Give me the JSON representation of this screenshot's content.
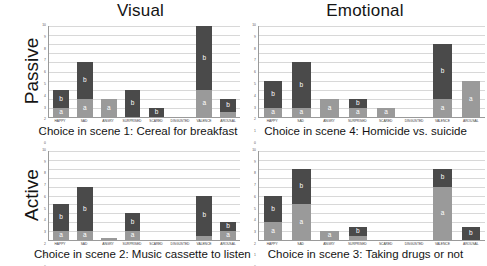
{
  "columns": [
    {
      "title": "Visual"
    },
    {
      "title": "Emotional"
    }
  ],
  "rows": [
    {
      "label": "Passive"
    },
    {
      "label": "Active"
    }
  ],
  "axis": {
    "ticks": [
      "0",
      "1",
      "2",
      "3",
      "4",
      "5",
      "6",
      "7",
      "8",
      "9",
      "10"
    ],
    "ymin": 0,
    "ymax": 10,
    "categories": [
      "HAPPY",
      "SAD",
      "ANGRY",
      "SURPRISED",
      "SCARED",
      "DISGUSTED",
      "VALENCE",
      "AROUSAL"
    ]
  },
  "legend": {
    "segment_a": "a",
    "segment_b": "b"
  },
  "colors": {
    "segment_a": "#9a9a9a",
    "segment_b": "#4a4a4a",
    "grid": "#d8d8d8",
    "axis": "#9a9a9a"
  },
  "chart_data": [
    {
      "type": "bar",
      "id": "panel-top-left",
      "title": "Visual",
      "row": "Passive",
      "caption": "Choice in scene 1: Cereal for breakfast",
      "xlabel": "",
      "ylabel": "",
      "ylim": [
        0,
        10
      ],
      "grid": true,
      "stacked": true,
      "categories": [
        "HAPPY",
        "SAD",
        "ANGRY",
        "SURPRISED",
        "SCARED",
        "DISGUSTED",
        "VALENCE",
        "AROUSAL"
      ],
      "series": [
        {
          "name": "a",
          "values": [
            1,
            2,
            2,
            0,
            0,
            0,
            3,
            0.5
          ]
        },
        {
          "name": "b",
          "values": [
            2,
            4,
            0,
            3,
            1,
            0,
            7,
            1.5
          ]
        }
      ],
      "totals": [
        3,
        6,
        2,
        3,
        1,
        0,
        10,
        2
      ]
    },
    {
      "type": "bar",
      "id": "panel-top-right",
      "title": "Emotional",
      "row": "Passive",
      "caption": "Choice in scene 4: Homicide vs. suicide",
      "xlabel": "",
      "ylabel": "",
      "ylim": [
        0,
        10
      ],
      "grid": true,
      "stacked": true,
      "categories": [
        "HAPPY",
        "SAD",
        "ANGRY",
        "SURPRISED",
        "SCARED",
        "DISGUSTED",
        "VALENCE",
        "AROUSAL"
      ],
      "series": [
        {
          "name": "a",
          "values": [
            1,
            1,
            2,
            1,
            1,
            0,
            2,
            4
          ]
        },
        {
          "name": "b",
          "values": [
            3,
            5,
            0,
            1,
            0,
            0,
            6,
            0
          ]
        }
      ],
      "totals": [
        4,
        6,
        2,
        2,
        1,
        0,
        8,
        4
      ]
    },
    {
      "type": "bar",
      "id": "panel-bottom-left",
      "title": "Visual",
      "row": "Active",
      "caption": "Choice in scene 2: Music cassette to listen",
      "xlabel": "",
      "ylabel": "",
      "ylim": [
        0,
        10
      ],
      "grid": true,
      "stacked": true,
      "categories": [
        "HAPPY",
        "SAD",
        "ANGRY",
        "SURPRISED",
        "SCARED",
        "DISGUSTED",
        "VALENCE",
        "AROUSAL"
      ],
      "series": [
        {
          "name": "a",
          "values": [
            1,
            1,
            0.5,
            1,
            0,
            0,
            0.5,
            1
          ]
        },
        {
          "name": "b",
          "values": [
            3,
            5,
            0,
            2,
            0,
            0,
            4.5,
            1
          ]
        }
      ],
      "totals": [
        4,
        6,
        0.5,
        3,
        0,
        0,
        5,
        2
      ]
    },
    {
      "type": "bar",
      "id": "panel-bottom-right",
      "title": "Emotional",
      "row": "Active",
      "caption": "Choice in scene 3: Taking drugs or not",
      "xlabel": "",
      "ylabel": "",
      "ylim": [
        0,
        10
      ],
      "grid": true,
      "stacked": true,
      "categories": [
        "HAPPY",
        "SAD",
        "ANGRY",
        "SURPRISED",
        "SCARED",
        "DISGUSTED",
        "VALENCE",
        "AROUSAL"
      ],
      "series": [
        {
          "name": "a",
          "values": [
            2,
            4,
            1,
            0.5,
            0,
            0,
            6,
            0
          ]
        },
        {
          "name": "b",
          "values": [
            3,
            4,
            0,
            1,
            0,
            0,
            2,
            1.5
          ]
        }
      ],
      "totals": [
        5,
        8,
        1,
        1.5,
        0,
        0,
        8,
        1.5
      ]
    }
  ]
}
